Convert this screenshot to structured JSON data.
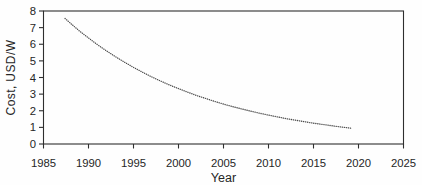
{
  "figure": {
    "background": "#fefefe",
    "axis_color": "#2e2e2e",
    "text_color": "#262626",
    "curve_color": "#4a4a4a"
  },
  "chart_data": {
    "type": "line",
    "style": "dense-dotted",
    "title": "",
    "xlabel": "Year",
    "ylabel": "Cost, USD/W",
    "xlim": [
      1985,
      2025
    ],
    "ylim": [
      0,
      8
    ],
    "x_ticks": [
      1985,
      1990,
      1995,
      2000,
      2005,
      2010,
      2015,
      2020,
      2025
    ],
    "y_ticks": [
      0,
      1,
      2,
      3,
      4,
      5,
      6,
      7,
      8
    ],
    "grid": false,
    "legend": false,
    "series": [
      {
        "name": "cost-curve",
        "marker": "dot",
        "points": [
          [
            1987.4,
            7.55
          ],
          [
            1988,
            7.26
          ],
          [
            1989,
            6.8
          ],
          [
            1990,
            6.38
          ],
          [
            1991,
            5.97
          ],
          [
            1992,
            5.6
          ],
          [
            1993,
            5.25
          ],
          [
            1994,
            4.92
          ],
          [
            1995,
            4.61
          ],
          [
            1996,
            4.32
          ],
          [
            1997,
            4.04
          ],
          [
            1998,
            3.79
          ],
          [
            1999,
            3.55
          ],
          [
            2000,
            3.33
          ],
          [
            2001,
            3.12
          ],
          [
            2002,
            2.92
          ],
          [
            2003,
            2.74
          ],
          [
            2004,
            2.56
          ],
          [
            2005,
            2.4
          ],
          [
            2006,
            2.25
          ],
          [
            2007,
            2.11
          ],
          [
            2008,
            1.98
          ],
          [
            2009,
            1.85
          ],
          [
            2010,
            1.74
          ],
          [
            2011,
            1.63
          ],
          [
            2012,
            1.52
          ],
          [
            2013,
            1.43
          ],
          [
            2014,
            1.34
          ],
          [
            2015,
            1.25
          ],
          [
            2016,
            1.18
          ],
          [
            2017,
            1.1
          ],
          [
            2018,
            1.03
          ],
          [
            2019.2,
            0.95
          ]
        ]
      }
    ]
  }
}
